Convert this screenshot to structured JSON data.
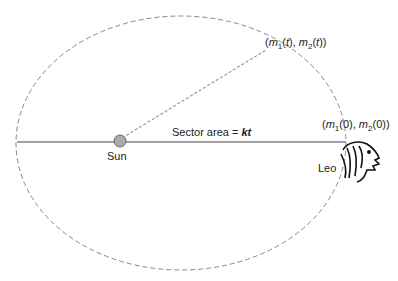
{
  "diagram": {
    "labels": {
      "point_t": [
        "(",
        "m",
        "1",
        "(",
        "t",
        "), ",
        "m",
        "2",
        "(",
        "t",
        "))"
      ],
      "point_t_text": "(m1(t), m2(t))",
      "point_0_text": "(m1(0), m2(0))",
      "sector_prefix": "Sector area = ",
      "sector_k": "kt",
      "sun": "Sun",
      "leo": "Leo"
    },
    "colors": {
      "orbit": "#888888",
      "sun_fill": "#aaaaaa",
      "line": "#444444"
    }
  }
}
